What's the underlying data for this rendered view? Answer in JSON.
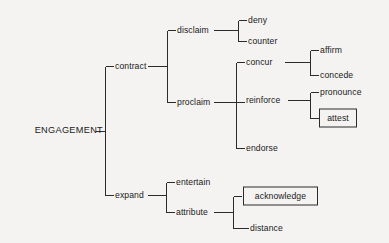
{
  "diagram": {
    "type": "tree",
    "background_color": "#f4f3f1",
    "line_color": "#2b2b2b",
    "text_color": "#1a1a1a",
    "root": {
      "label": "ENGAGEMENT",
      "x": 103,
      "y": 131,
      "anchor": "right"
    },
    "nodes": [
      {
        "id": "contract",
        "label": "contract",
        "x": 115,
        "y": 66,
        "anchor": "left",
        "boxed": false
      },
      {
        "id": "expand",
        "label": "expand",
        "x": 115,
        "y": 195,
        "anchor": "left",
        "boxed": false
      },
      {
        "id": "disclaim",
        "label": "disclaim",
        "x": 177,
        "y": 30,
        "anchor": "left",
        "boxed": false
      },
      {
        "id": "proclaim",
        "label": "proclaim",
        "x": 177,
        "y": 102,
        "anchor": "left",
        "boxed": false
      },
      {
        "id": "deny",
        "label": "deny",
        "x": 248,
        "y": 20,
        "anchor": "left",
        "boxed": false
      },
      {
        "id": "counter",
        "label": "counter",
        "x": 248,
        "y": 41,
        "anchor": "left",
        "boxed": false
      },
      {
        "id": "concur",
        "label": "concur",
        "x": 246,
        "y": 62,
        "anchor": "left",
        "boxed": false
      },
      {
        "id": "reinforce",
        "label": "reinforce",
        "x": 246,
        "y": 100,
        "anchor": "left",
        "boxed": false
      },
      {
        "id": "endorse",
        "label": "endorse",
        "x": 246,
        "y": 148,
        "anchor": "left",
        "boxed": false
      },
      {
        "id": "affirm",
        "label": "affirm",
        "x": 320,
        "y": 50,
        "anchor": "left",
        "boxed": false
      },
      {
        "id": "concede",
        "label": "concede",
        "x": 320,
        "y": 75,
        "anchor": "left",
        "boxed": false
      },
      {
        "id": "pronounce",
        "label": "pronounce",
        "x": 320,
        "y": 92,
        "anchor": "left",
        "boxed": false
      },
      {
        "id": "attest",
        "label": "attest",
        "x": 320,
        "y": 118,
        "anchor": "left",
        "boxed": true,
        "box": {
          "x": 319,
          "y": 118,
          "w": 38,
          "h": 19
        }
      },
      {
        "id": "entertain",
        "label": "entertain",
        "x": 176,
        "y": 182,
        "anchor": "left",
        "boxed": false
      },
      {
        "id": "attribute",
        "label": "attribute",
        "x": 176,
        "y": 212,
        "anchor": "left",
        "boxed": false
      },
      {
        "id": "acknowledge",
        "label": "acknowledge",
        "x": 243,
        "y": 196,
        "anchor": "left",
        "boxed": true,
        "box": {
          "x": 243,
          "y": 196,
          "w": 75,
          "h": 19
        }
      },
      {
        "id": "distance",
        "label": "distance",
        "x": 250,
        "y": 228,
        "anchor": "left",
        "boxed": false
      }
    ],
    "connectors": [
      {
        "from": "ENGAGEMENT",
        "to": "contract, expand",
        "trunk_x": 105,
        "top_y": 66,
        "bottom_y": 195
      },
      {
        "from": "contract",
        "to": "disclaim, proclaim",
        "trunk_x": 167,
        "top_y": 30,
        "bottom_y": 102
      },
      {
        "from": "disclaim",
        "to": "deny, counter",
        "trunk_x": 238,
        "top_y": 20,
        "bottom_y": 41
      },
      {
        "from": "proclaim",
        "to": "concur, reinforce, endorse",
        "trunk_x": 236,
        "top_y": 62,
        "bottom_y": 148
      },
      {
        "from": "concur",
        "to": "affirm, concede",
        "trunk_x": 310,
        "top_y": 50,
        "bottom_y": 75
      },
      {
        "from": "reinforce",
        "to": "pronounce, attest",
        "trunk_x": 310,
        "top_y": 92,
        "bottom_y": 118
      },
      {
        "from": "expand",
        "to": "entertain, attribute",
        "trunk_x": 166,
        "top_y": 182,
        "bottom_y": 212
      },
      {
        "from": "attribute",
        "to": "acknowledge, distance",
        "trunk_x": 233,
        "top_y": 196,
        "bottom_y": 228
      }
    ]
  }
}
